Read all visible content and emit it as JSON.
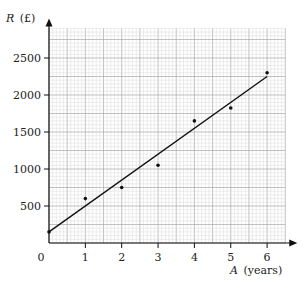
{
  "chart_data": {
    "type": "scatter",
    "title": "",
    "xlabel": "A (years)",
    "ylabel": "R (£)",
    "xlabel_var": "A",
    "xlabel_unit": "(years)",
    "ylabel_var": "R",
    "ylabel_unit": "(£)",
    "x_ticks": [
      0,
      1,
      2,
      3,
      4,
      5,
      6
    ],
    "y_ticks": [
      500,
      1000,
      1500,
      2000,
      2500
    ],
    "origin_label": "0",
    "xlim": [
      0,
      6.5
    ],
    "ylim": [
      0,
      2900
    ],
    "grid": true,
    "grid_minor_x": 0.1,
    "grid_minor_y": 50,
    "grid_major_x": 0.5,
    "grid_major_y": 250,
    "legend": null,
    "series": [
      {
        "name": "data points",
        "type": "scatter",
        "x": [
          0,
          1,
          2,
          3,
          4,
          5,
          6
        ],
        "y": [
          150,
          600,
          750,
          1050,
          1650,
          1825,
          2300
        ]
      },
      {
        "name": "line of best fit",
        "type": "line",
        "x": [
          0,
          6
        ],
        "y": [
          150,
          2250
        ]
      }
    ],
    "colors": {
      "grid_minor": "#d6d6d6",
      "grid_major": "#a8a8a8",
      "axis": "#111111",
      "points": "#111111",
      "line": "#111111"
    }
  }
}
